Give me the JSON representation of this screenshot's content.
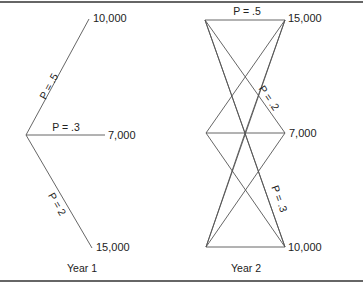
{
  "diagram": {
    "type": "probability-tree",
    "year1": {
      "label": "Year 1",
      "branches": [
        {
          "id": "top",
          "probability_label": "P = .5",
          "value_label": "10,000"
        },
        {
          "id": "mid",
          "probability_label": "P = .3",
          "value_label": "7,000"
        },
        {
          "id": "bot",
          "probability_label": "P = 2",
          "value_label": "15,000"
        }
      ]
    },
    "year2": {
      "label": "Year 2",
      "outcomes": [
        {
          "id": "top",
          "value_label": "15,000"
        },
        {
          "id": "mid",
          "value_label": "7,000"
        },
        {
          "id": "bot",
          "value_label": "10,000"
        }
      ],
      "probability_labels": [
        {
          "id": "top-edge",
          "text": "P = .5"
        },
        {
          "id": "diag-a",
          "text": "P = .2"
        },
        {
          "id": "diag-b",
          "text": "P = .3"
        }
      ]
    },
    "colors": {
      "line": "#555555",
      "text": "#222222",
      "frame": "#333333",
      "background": "#ffffff"
    }
  }
}
